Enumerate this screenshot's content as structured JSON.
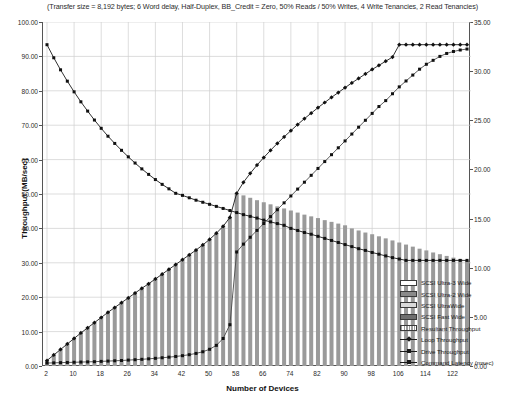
{
  "chart_data": {
    "type": "bar",
    "title": "",
    "subtitle": "(Transfer size = 8,192 bytes; 6 Word delay, Half-Duplex, BB_Credit = Zero, 50% Reads / 50% Writes, 4 Write Tenancies, 2 Read Tenancies)",
    "xlabel": "Number of Devices",
    "ylabel": "Throughput (MB/sec)",
    "ylabel_right": "Loop Overhead per Command (msec)",
    "grid": true,
    "legend_position": "right-inside",
    "xlim": [
      2,
      126
    ],
    "ylim": [
      0,
      100
    ],
    "ylim_right": [
      0,
      35
    ],
    "xticks": [
      2,
      10,
      18,
      26,
      34,
      42,
      50,
      58,
      66,
      74,
      82,
      90,
      98,
      106,
      114,
      122
    ],
    "yticks": [
      "0.00",
      "10.00",
      "20.00",
      "30.00",
      "40.00",
      "50.00",
      "60.00",
      "70.00",
      "80.00",
      "90.00",
      "100.00"
    ],
    "yticks_right": [
      "0.00",
      "5.00",
      "10.00",
      "15.00",
      "20.00",
      "25.00",
      "30.00",
      "35.00"
    ],
    "x": [
      2,
      4,
      6,
      8,
      10,
      12,
      14,
      16,
      18,
      20,
      22,
      24,
      26,
      28,
      30,
      32,
      34,
      36,
      38,
      40,
      42,
      44,
      46,
      48,
      50,
      52,
      54,
      56,
      58,
      60,
      62,
      64,
      66,
      68,
      70,
      72,
      74,
      76,
      78,
      80,
      82,
      84,
      86,
      88,
      90,
      92,
      94,
      96,
      98,
      100,
      102,
      104,
      106,
      108,
      110,
      112,
      114,
      116,
      118,
      120,
      122,
      124,
      126
    ],
    "series": [
      {
        "name": "Resultant Throughput",
        "type": "bar",
        "axis": "left",
        "values": [
          1.6,
          3.2,
          4.8,
          6.4,
          8.0,
          9.6,
          11.1,
          12.6,
          14.1,
          15.6,
          17.0,
          18.4,
          19.8,
          21.2,
          22.6,
          23.9,
          25.3,
          26.7,
          28.1,
          29.5,
          30.9,
          32.3,
          33.7,
          35.2,
          36.8,
          38.6,
          40.6,
          43.2,
          50.2,
          49.6,
          48.9,
          48.2,
          47.6,
          47.0,
          46.4,
          45.8,
          45.2,
          44.6,
          44.0,
          43.5,
          43.0,
          42.4,
          41.9,
          41.4,
          40.9,
          40.0,
          39.4,
          38.8,
          38.3,
          37.7,
          37.1,
          36.5,
          35.9,
          35.3,
          34.7,
          34.1,
          33.6,
          33.0,
          32.5,
          32.0,
          31.5,
          31.1,
          30.7
        ]
      },
      {
        "name": "Loop Throughput",
        "type": "line",
        "axis": "left",
        "marker": "diamond",
        "values": [
          1.6,
          3.2,
          4.8,
          6.4,
          8.0,
          9.6,
          11.1,
          12.6,
          14.1,
          15.6,
          17.0,
          18.4,
          19.8,
          21.2,
          22.6,
          23.9,
          25.3,
          26.7,
          28.1,
          29.5,
          30.9,
          32.3,
          33.7,
          35.2,
          36.8,
          38.6,
          40.6,
          43.2,
          50.2,
          53.4,
          56.0,
          58.4,
          60.6,
          62.7,
          64.7,
          66.6,
          68.4,
          70.2,
          71.9,
          73.5,
          75.1,
          76.6,
          78.1,
          79.5,
          80.9,
          82.3,
          83.6,
          84.9,
          86.2,
          87.4,
          88.6,
          89.8,
          93.4,
          93.4,
          93.4,
          93.4,
          93.4,
          93.4,
          93.4,
          93.4,
          93.4,
          93.4,
          93.4
        ]
      },
      {
        "name": "Drive Throughput",
        "type": "line",
        "axis": "left",
        "marker": "square",
        "values": [
          93.4,
          89.6,
          86.1,
          82.8,
          79.7,
          76.8,
          74.1,
          71.5,
          69.1,
          66.8,
          64.7,
          62.7,
          60.8,
          59.0,
          57.3,
          55.7,
          54.2,
          52.8,
          51.5,
          50.2,
          49.6,
          48.9,
          48.2,
          47.6,
          47.0,
          46.4,
          45.8,
          45.2,
          44.6,
          44.0,
          43.5,
          43.0,
          42.4,
          41.9,
          41.4,
          40.9,
          40.0,
          39.4,
          38.8,
          38.3,
          37.7,
          37.1,
          36.5,
          35.9,
          35.3,
          34.7,
          34.1,
          33.6,
          33.0,
          32.5,
          32.0,
          31.5,
          31.1,
          30.7,
          30.7,
          30.7,
          30.7,
          30.7,
          30.7,
          30.7,
          30.7,
          30.7,
          30.7
        ]
      },
      {
        "name": "Command Latency (msec)",
        "type": "line",
        "axis": "right",
        "marker": "square",
        "values": [
          0.3,
          0.32,
          0.34,
          0.36,
          0.38,
          0.4,
          0.42,
          0.44,
          0.47,
          0.5,
          0.53,
          0.56,
          0.6,
          0.64,
          0.68,
          0.73,
          0.78,
          0.84,
          0.9,
          0.97,
          1.05,
          1.15,
          1.28,
          1.45,
          1.7,
          2.1,
          2.8,
          4.2,
          11.6,
          12.4,
          13.1,
          13.8,
          14.5,
          15.2,
          15.9,
          16.6,
          17.3,
          18.0,
          18.7,
          19.4,
          20.1,
          20.8,
          21.5,
          22.2,
          22.9,
          23.6,
          24.3,
          25.0,
          25.7,
          26.4,
          27.0,
          27.7,
          28.4,
          29.0,
          29.6,
          30.2,
          30.7,
          31.1,
          31.5,
          31.8,
          32.0,
          32.15,
          32.25
        ]
      }
    ]
  },
  "legend": {
    "items": [
      {
        "label": "SCSI Ultra-3 Wide",
        "key": "box",
        "fill": "#ffffff"
      },
      {
        "label": "SCSI Ultra-2 Wide",
        "key": "box",
        "fill": "#8a8a8a"
      },
      {
        "label": "SCSI UltraWide",
        "key": "box",
        "fill": "#d9d9d9"
      },
      {
        "label": "SCSI Fast Wide",
        "key": "box",
        "fill": "#6f6f6f"
      },
      {
        "label": "Resultant Throughput",
        "key": "bar-hatch",
        "fill": "#9a9a9a"
      },
      {
        "label": "Loop Throughput",
        "key": "line-diamond",
        "fill": "#1a1a1a"
      },
      {
        "label": "Drive Throughput",
        "key": "line-square",
        "fill": "#1a1a1a"
      },
      {
        "label": "Command Latency (msec)",
        "key": "line-square",
        "fill": "#1a1a1a"
      }
    ]
  },
  "colors": {
    "bar": "#9a9a9a",
    "line": "#1a1a1a",
    "latency_line": "#4a4a4a",
    "grid": "#cfcfcf",
    "axis": "#555555",
    "text": "#1a1a1a"
  }
}
